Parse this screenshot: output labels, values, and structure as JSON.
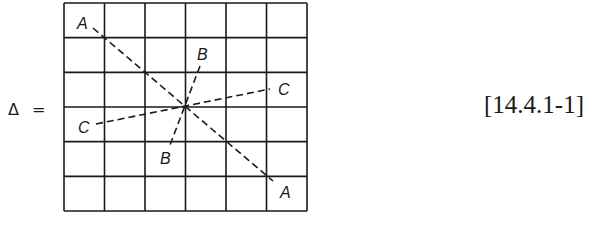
{
  "equation": {
    "lhs": "Δ =",
    "number": "[14.4.1-1]"
  },
  "grid": {
    "rows": 6,
    "cols": 6,
    "x0": 64,
    "y0": 3,
    "x1": 307,
    "y1": 211
  },
  "lines": [
    {
      "name": "A",
      "from": [
        93,
        28
      ],
      "to": [
        273,
        181
      ],
      "label_start": "A",
      "label_end": "A"
    },
    {
      "name": "B",
      "from": [
        200,
        66
      ],
      "to": [
        170,
        145
      ],
      "label_start": "B",
      "label_end": "B"
    },
    {
      "name": "C",
      "from": [
        96,
        124
      ],
      "to": [
        270,
        89
      ],
      "label_start": "C",
      "label_end": "C"
    }
  ],
  "labels": [
    {
      "text": "A",
      "x": 77,
      "y": 29
    },
    {
      "text": "B",
      "x": 197,
      "y": 60
    },
    {
      "text": "C",
      "x": 278,
      "y": 95
    },
    {
      "text": "C",
      "x": 78,
      "y": 133
    },
    {
      "text": "B",
      "x": 160,
      "y": 164
    },
    {
      "text": "A",
      "x": 280,
      "y": 198
    }
  ]
}
